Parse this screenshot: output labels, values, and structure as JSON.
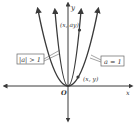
{
  "diagram": {
    "axes": {
      "x_label": "x",
      "y_label": "y",
      "origin_label": "O"
    },
    "curves": [
      {
        "name": "a = 1",
        "label": "a = 1",
        "point_label": "(x, y)"
      },
      {
        "name": "|a| > 1",
        "label": "|a| > 1",
        "point_label": "(x, ay)"
      }
    ],
    "colors": {
      "curve": "#3a3a3a",
      "axis": "#3a3a3a",
      "label_box_border": "#666666"
    }
  }
}
